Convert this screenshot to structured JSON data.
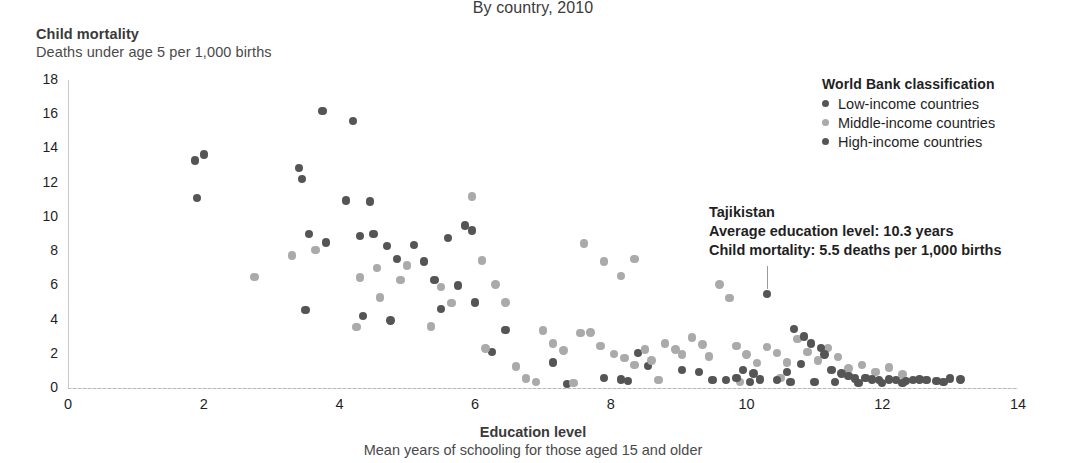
{
  "subtitle": "By country, 2010",
  "axes": {
    "y_title": "Child mortality",
    "y_subtitle": "Deaths under age 5 per 1,000 births",
    "x_title": "Education level",
    "x_subtitle": "Mean years of schooling for those aged 15 and older"
  },
  "legend": {
    "title": "World Bank classification",
    "items": [
      {
        "label": "Low-income countries",
        "color": "#555555"
      },
      {
        "label": "Middle-income countries",
        "color": "#aaaaaa"
      },
      {
        "label": "High-income countries",
        "color": "#555555"
      }
    ]
  },
  "annotation": {
    "line1": "Tajikistan",
    "line2": "Average education level: 10.3 years",
    "line3": "Child mortality: 5.5 deaths per 1,000 births",
    "point": {
      "x": 10.3,
      "y": 5.5
    }
  },
  "chart_data": {
    "type": "scatter",
    "title": "By country, 2010",
    "xlabel": "Education level",
    "ylabel": "Child mortality",
    "xlim": [
      0,
      14
    ],
    "ylim": [
      0,
      18
    ],
    "xticks": [
      0,
      2,
      4,
      6,
      8,
      10,
      12,
      14
    ],
    "yticks": [
      0,
      2,
      4,
      6,
      8,
      10,
      12,
      14,
      16,
      18
    ],
    "grid": false,
    "legend_position": "top-right",
    "series": [
      {
        "name": "Low-income countries",
        "color": "#555555",
        "points": [
          [
            1.87,
            13.3
          ],
          [
            2.0,
            13.65
          ],
          [
            1.9,
            11.1
          ],
          [
            3.4,
            12.85
          ],
          [
            3.45,
            12.2
          ],
          [
            3.75,
            16.2
          ],
          [
            4.2,
            15.6
          ],
          [
            4.1,
            10.95
          ],
          [
            4.45,
            10.9
          ],
          [
            3.55,
            9.0
          ],
          [
            3.8,
            8.5
          ],
          [
            4.3,
            8.9
          ],
          [
            4.5,
            9.0
          ],
          [
            4.7,
            8.3
          ],
          [
            5.1,
            8.35
          ],
          [
            5.6,
            8.75
          ],
          [
            5.85,
            9.5
          ],
          [
            5.95,
            9.2
          ],
          [
            4.85,
            7.55
          ],
          [
            5.25,
            7.4
          ],
          [
            3.5,
            4.55
          ],
          [
            4.35,
            4.2
          ],
          [
            4.75,
            3.95
          ],
          [
            5.4,
            6.3
          ],
          [
            5.75,
            6.0
          ],
          [
            6.0,
            5.0
          ],
          [
            5.5,
            4.6
          ],
          [
            6.45,
            3.4
          ],
          [
            6.25,
            2.1
          ],
          [
            7.15,
            1.5
          ],
          [
            7.35,
            0.25
          ],
          [
            8.4,
            2.05
          ],
          [
            8.55,
            1.3
          ],
          [
            9.05,
            1.05
          ],
          [
            9.3,
            0.95
          ],
          [
            9.5,
            0.45
          ],
          [
            8.15,
            0.5
          ],
          [
            8.25,
            0.4
          ],
          [
            7.9,
            0.6
          ]
        ]
      },
      {
        "name": "Middle-income countries",
        "color": "#aaaaaa",
        "points": [
          [
            2.75,
            6.5
          ],
          [
            3.3,
            7.75
          ],
          [
            3.65,
            8.05
          ],
          [
            4.3,
            6.45
          ],
          [
            4.55,
            7.0
          ],
          [
            4.6,
            5.3
          ],
          [
            4.25,
            3.55
          ],
          [
            4.9,
            6.3
          ],
          [
            5.0,
            7.15
          ],
          [
            5.35,
            3.6
          ],
          [
            5.5,
            5.9
          ],
          [
            5.65,
            4.95
          ],
          [
            5.95,
            11.2
          ],
          [
            6.1,
            7.45
          ],
          [
            6.3,
            6.05
          ],
          [
            6.45,
            5.0
          ],
          [
            6.15,
            2.3
          ],
          [
            6.6,
            1.25
          ],
          [
            6.75,
            0.55
          ],
          [
            7.0,
            3.35
          ],
          [
            7.15,
            2.6
          ],
          [
            7.3,
            2.2
          ],
          [
            7.55,
            3.2
          ],
          [
            7.7,
            3.25
          ],
          [
            7.6,
            8.45
          ],
          [
            7.9,
            7.4
          ],
          [
            8.15,
            6.55
          ],
          [
            8.35,
            7.55
          ],
          [
            7.85,
            2.45
          ],
          [
            8.05,
            2.0
          ],
          [
            8.2,
            1.75
          ],
          [
            8.35,
            1.35
          ],
          [
            8.5,
            2.25
          ],
          [
            8.6,
            1.6
          ],
          [
            8.8,
            2.6
          ],
          [
            8.95,
            2.25
          ],
          [
            9.05,
            1.95
          ],
          [
            9.2,
            2.95
          ],
          [
            9.35,
            2.55
          ],
          [
            9.45,
            1.85
          ],
          [
            9.6,
            6.05
          ],
          [
            9.75,
            5.25
          ],
          [
            9.85,
            2.45
          ],
          [
            10.0,
            1.95
          ],
          [
            10.15,
            1.45
          ],
          [
            10.3,
            2.4
          ],
          [
            10.45,
            2.05
          ],
          [
            10.6,
            1.5
          ],
          [
            10.75,
            2.85
          ],
          [
            10.9,
            2.1
          ],
          [
            11.05,
            1.6
          ],
          [
            11.2,
            2.35
          ],
          [
            11.35,
            1.8
          ],
          [
            11.5,
            1.15
          ],
          [
            11.7,
            1.35
          ],
          [
            11.9,
            0.95
          ],
          [
            12.1,
            1.2
          ],
          [
            12.3,
            0.8
          ],
          [
            6.9,
            0.35
          ],
          [
            7.45,
            0.3
          ],
          [
            8.7,
            0.45
          ],
          [
            9.9,
            0.35
          ],
          [
            10.5,
            0.6
          ]
        ]
      },
      {
        "name": "High-income countries",
        "color": "#555555",
        "points": [
          [
            10.3,
            5.5
          ],
          [
            10.7,
            3.45
          ],
          [
            10.85,
            3.0
          ],
          [
            10.95,
            2.6
          ],
          [
            10.8,
            1.4
          ],
          [
            10.6,
            0.95
          ],
          [
            10.45,
            0.45
          ],
          [
            11.1,
            2.35
          ],
          [
            11.15,
            1.95
          ],
          [
            11.25,
            1.05
          ],
          [
            11.4,
            0.85
          ],
          [
            11.5,
            0.7
          ],
          [
            11.6,
            0.55
          ],
          [
            11.75,
            0.6
          ],
          [
            11.85,
            0.5
          ],
          [
            11.95,
            0.45
          ],
          [
            12.1,
            0.5
          ],
          [
            12.2,
            0.45
          ],
          [
            12.35,
            0.4
          ],
          [
            12.45,
            0.45
          ],
          [
            12.55,
            0.5
          ],
          [
            12.65,
            0.45
          ],
          [
            12.8,
            0.4
          ],
          [
            13.0,
            0.55
          ],
          [
            13.15,
            0.5
          ],
          [
            9.95,
            1.05
          ],
          [
            10.1,
            0.85
          ],
          [
            10.2,
            0.5
          ],
          [
            9.7,
            0.45
          ],
          [
            9.85,
            0.6
          ],
          [
            10.05,
            0.35
          ],
          [
            10.65,
            0.35
          ],
          [
            11.0,
            0.35
          ],
          [
            11.3,
            0.35
          ],
          [
            11.65,
            0.3
          ],
          [
            12.0,
            0.3
          ],
          [
            12.3,
            0.3
          ],
          [
            12.9,
            0.35
          ]
        ]
      }
    ]
  }
}
